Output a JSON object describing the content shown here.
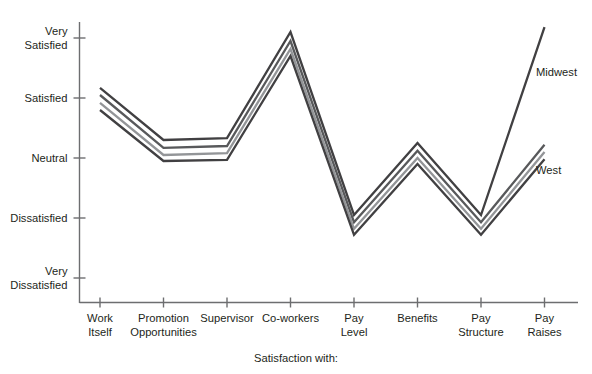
{
  "chart_data": {
    "type": "line",
    "title": "",
    "xlabel": "Satisfaction with:",
    "ylabel": "",
    "grid": false,
    "legend_position": "inline-right",
    "categories": [
      "Work Itself",
      "Promotion Opportunities",
      "Supervisor",
      "Co-workers",
      "Pay Level",
      "Benefits",
      "Pay Structure",
      "Pay Raises"
    ],
    "category_lines": [
      [
        "Work",
        "Itself"
      ],
      [
        "Promotion",
        "Opportunities"
      ],
      [
        "Supervisor",
        ""
      ],
      [
        "Co-workers",
        ""
      ],
      [
        "Pay",
        "Level"
      ],
      [
        "Benefits",
        ""
      ],
      [
        "Pay",
        "Structure"
      ],
      [
        "Pay",
        "Raises"
      ]
    ],
    "ytick_labels": [
      [
        "Very",
        "Satisfied"
      ],
      [
        "Satisfied",
        ""
      ],
      [
        "Neutral",
        ""
      ],
      [
        "Dissatisfied",
        ""
      ],
      [
        "Very",
        "Dissatisfied"
      ]
    ],
    "ytick_values": [
      5,
      4,
      3,
      2,
      1
    ],
    "ylim": [
      1,
      5
    ],
    "series": [
      {
        "name": "Midwest",
        "color": "#414042",
        "label_shown": true,
        "values": [
          4.17,
          3.3,
          3.33,
          5.1,
          2.05,
          3.25,
          2.05,
          5.18
        ]
      },
      {
        "name": "Series 2",
        "color": "#58595b",
        "label_shown": false,
        "values": [
          4.05,
          3.17,
          3.2,
          4.95,
          1.93,
          3.12,
          1.93,
          3.22
        ]
      },
      {
        "name": "Series 3",
        "color": "#939598",
        "label_shown": false,
        "values": [
          3.92,
          3.05,
          3.08,
          4.82,
          1.82,
          3.0,
          1.82,
          3.1
        ]
      },
      {
        "name": "West",
        "color": "#414042",
        "label_shown": true,
        "values": [
          3.8,
          2.95,
          2.97,
          4.7,
          1.72,
          2.9,
          1.72,
          2.98
        ]
      }
    ],
    "annotations": [
      {
        "text": "Midwest",
        "x": 536,
        "y": 76
      },
      {
        "text": "West",
        "x": 536,
        "y": 174
      }
    ]
  }
}
